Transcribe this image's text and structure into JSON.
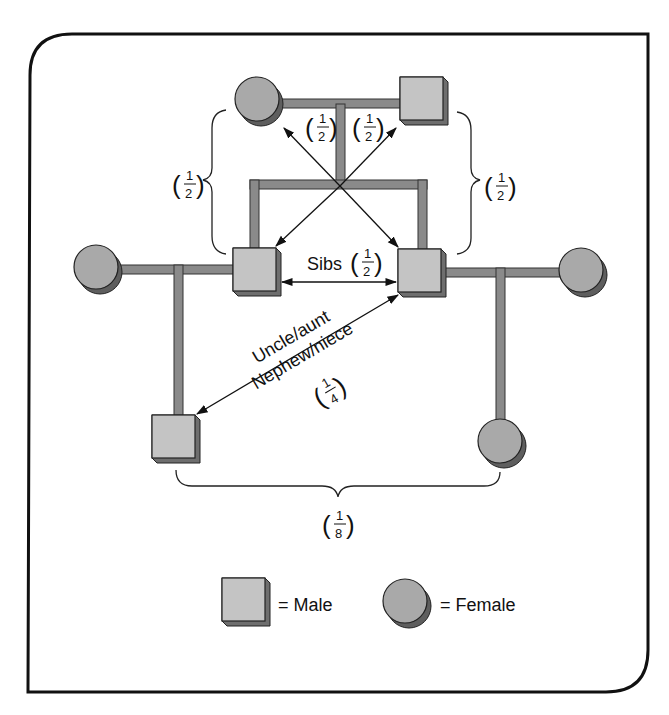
{
  "diagram": {
    "colors": {
      "frame": "#111111",
      "line_fill": "#8a8a8a",
      "line_edge": "#333333",
      "male_face": "#c4c4c4",
      "male_side": "#6e6e6e",
      "female_face": "#a9a9a9",
      "female_shadow": "#5e5e5e"
    },
    "labels": {
      "parent_left_fraction": {
        "num": "1",
        "den": "2"
      },
      "parent_right_fraction": {
        "num": "1",
        "den": "2"
      },
      "brace_left_fraction": {
        "num": "1",
        "den": "2"
      },
      "brace_right_fraction": {
        "num": "1",
        "den": "2"
      },
      "sibs_text": "Sibs",
      "sibs_fraction": {
        "num": "1",
        "den": "2"
      },
      "uncle_aunt_text": "Uncle/aunt",
      "nephew_niece_text": "Nephew/niece",
      "uncle_fraction": {
        "num": "1",
        "den": "4"
      },
      "cousin_fraction": {
        "num": "1",
        "den": "8"
      }
    },
    "individuals": [
      {
        "id": "grandmother",
        "sex": "female",
        "generation": 1
      },
      {
        "id": "grandfather",
        "sex": "male",
        "generation": 1
      },
      {
        "id": "sibling-left",
        "sex": "male",
        "generation": 2
      },
      {
        "id": "sibling-right",
        "sex": "male",
        "generation": 2
      },
      {
        "id": "spouse-left",
        "sex": "female",
        "generation": 2
      },
      {
        "id": "spouse-right",
        "sex": "female",
        "generation": 2
      },
      {
        "id": "child-left",
        "sex": "male",
        "generation": 3
      },
      {
        "id": "child-right",
        "sex": "female",
        "generation": 3
      }
    ],
    "relationships": [
      {
        "from": "grandmother",
        "to": "sibling-right",
        "coefficient": "1/2"
      },
      {
        "from": "grandfather",
        "to": "sibling-left",
        "coefficient": "1/2"
      },
      {
        "from": "sibling-left",
        "to": "sibling-right",
        "label": "Sibs",
        "coefficient": "1/2"
      },
      {
        "from": "sibling-right",
        "to": "child-left",
        "label": "Uncle/aunt Nephew/niece",
        "coefficient": "1/4"
      },
      {
        "from": "child-left",
        "to": "child-right",
        "coefficient": "1/8"
      }
    ],
    "legend": {
      "male_label": "= Male",
      "female_label": "= Female"
    }
  }
}
